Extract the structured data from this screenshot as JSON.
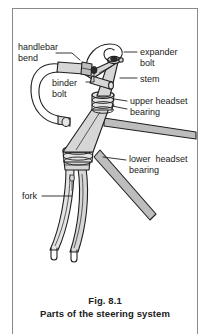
{
  "figure": {
    "caption_number": "Fig. 8.1",
    "caption_title": "Parts of the steering system"
  },
  "colors": {
    "tube_fill": "#d6d6d6",
    "tube_fill_light": "#e4e4e4",
    "tube_fill_dark": "#bdbdbd",
    "outline": "#1f1f1f",
    "frame_border": "#8a8a8a",
    "text": "#1a1a1a",
    "background": "#ffffff"
  },
  "labels": [
    {
      "id": "handlebar-bend",
      "line1": "handlebar",
      "line2": "bend",
      "x": 18,
      "y": 42,
      "align": "left"
    },
    {
      "id": "binder-bolt",
      "line1": "binder",
      "line2": "bolt",
      "x": 52,
      "y": 78,
      "align": "left"
    },
    {
      "id": "expander-bolt",
      "line1": "expander",
      "line2": "bolt",
      "x": 140,
      "y": 47,
      "align": "left"
    },
    {
      "id": "stem",
      "line1": "stem",
      "line2": "",
      "x": 140,
      "y": 74,
      "align": "left"
    },
    {
      "id": "upper-headset-bearing",
      "line1": "upper headset",
      "line2": "bearing",
      "x": 130,
      "y": 97,
      "align": "left"
    },
    {
      "id": "lower-headset-bearing",
      "line1": "lower  headset",
      "line2": "bearing",
      "x": 129,
      "y": 155,
      "align": "left"
    },
    {
      "id": "fork",
      "line1": "fork",
      "line2": "",
      "x": 22,
      "y": 191,
      "align": "left"
    }
  ],
  "leader_lines": [
    {
      "id": "leader-handlebar-bend",
      "points": "56,53 72,53 80,60"
    },
    {
      "id": "leader-binder-bolt",
      "points": "86,82 94,82 94,72"
    },
    {
      "id": "leader-expander-bolt",
      "points": "137,52 125,52"
    },
    {
      "id": "leader-stem",
      "points": "137,78 121,78"
    },
    {
      "id": "leader-upper-headset-bearing-a",
      "points": "127,101 114,101"
    },
    {
      "id": "leader-upper-headset-bearing-b",
      "points": "127,109 112,105"
    },
    {
      "id": "leader-lower-headset-bearing",
      "points": "126,160 103,157"
    },
    {
      "id": "leader-fork",
      "points": "42,196 72,196"
    }
  ],
  "parts": [
    {
      "id": "handlebar",
      "name": "handlebar bend"
    },
    {
      "id": "binder-bolt",
      "name": "binder bolt"
    },
    {
      "id": "expander-bolt",
      "name": "expander bolt"
    },
    {
      "id": "stem",
      "name": "stem"
    },
    {
      "id": "upper-bearing",
      "name": "upper headset bearing"
    },
    {
      "id": "head-tube",
      "name": "head tube"
    },
    {
      "id": "lower-bearing",
      "name": "lower headset bearing"
    },
    {
      "id": "top-tube",
      "name": "top tube"
    },
    {
      "id": "down-tube",
      "name": "down tube"
    },
    {
      "id": "fork",
      "name": "fork"
    },
    {
      "id": "fork-dropouts",
      "name": "fork dropouts"
    }
  ]
}
